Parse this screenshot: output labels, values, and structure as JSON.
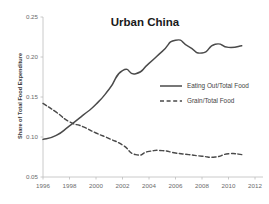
{
  "chart_data": {
    "type": "line",
    "title": "Urban China",
    "xlabel": "",
    "ylabel": "Share of Total Food Expenditure",
    "xlim": [
      1996,
      2012
    ],
    "ylim": [
      0.05,
      0.25
    ],
    "grid": false,
    "legend_position": "center-right",
    "x_ticks": [
      "1996",
      "1998",
      "2000",
      "2002",
      "2004",
      "2006",
      "2008",
      "2010",
      "2012"
    ],
    "x_tick_values": [
      1996,
      1998,
      2000,
      2002,
      2004,
      2006,
      2008,
      2010,
      2012
    ],
    "y_ticks": [
      "0.05",
      "0.10",
      "0.15",
      "0.20",
      "0.25"
    ],
    "y_tick_values": [
      0.05,
      0.1,
      0.15,
      0.2,
      0.25
    ],
    "x": [
      1996,
      1997,
      1998,
      1999,
      2000,
      2001,
      2002,
      2003,
      2004,
      2005,
      2006,
      2007,
      2008,
      2009,
      2010,
      2011
    ],
    "series": [
      {
        "name": "Eating Out/Total Food",
        "style": "solid",
        "color": "#4a4a4a",
        "values": [
          0.097,
          0.102,
          0.114,
          0.127,
          0.141,
          0.16,
          0.183,
          0.179,
          0.192,
          0.207,
          0.221,
          0.213,
          0.205,
          0.216,
          0.212,
          0.214
        ]
      },
      {
        "name": "Grain/Total Food",
        "style": "dashed",
        "color": "#4a4a4a",
        "values": [
          0.142,
          0.131,
          0.119,
          0.113,
          0.105,
          0.098,
          0.09,
          0.078,
          0.082,
          0.083,
          0.08,
          0.078,
          0.076,
          0.075,
          0.079,
          0.078
        ]
      }
    ]
  },
  "legend": {
    "items": [
      {
        "label": "Eating Out/Total Food",
        "style": "solid"
      },
      {
        "label": "Grain/Total Food",
        "style": "dashed"
      }
    ]
  }
}
